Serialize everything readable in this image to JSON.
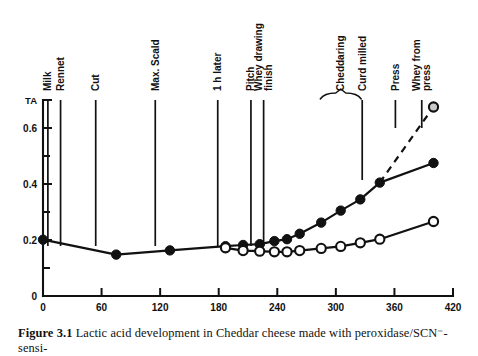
{
  "figure": {
    "caption_label": "Figure 3.1",
    "caption_text": "Lactic acid development in Cheddar cheese made with peroxidase/SCN⁻-sensi-"
  },
  "chart_data": {
    "type": "line",
    "title": "",
    "xlabel": "Time, min",
    "ylabel": "TA",
    "xlim": [
      0,
      420
    ],
    "ylim": [
      0,
      0.72
    ],
    "grid": false,
    "legend_position": "none",
    "x_ticks": [
      0,
      60,
      120,
      180,
      240,
      300,
      360,
      420
    ],
    "x_tick_labels": [
      "0",
      "60",
      "120",
      "180",
      "240",
      "300",
      "360",
      "420"
    ],
    "y_ticks": [
      0,
      0.2,
      0.4,
      0.6
    ],
    "y_tick_labels": [
      "0",
      "0.2",
      "0.4",
      "0.6"
    ],
    "y_minor_ticks": [
      0.1,
      0.3,
      0.5,
      0.7
    ],
    "series": [
      {
        "name": "control",
        "marker": "filled-circle",
        "linestyle": "solid",
        "x": [
          0,
          75,
          130,
          187,
          205,
          222,
          237,
          250,
          263,
          285,
          305,
          325,
          345,
          400
        ],
        "y": [
          0.201,
          0.148,
          0.163,
          0.178,
          0.182,
          0.185,
          0.196,
          0.203,
          0.222,
          0.262,
          0.305,
          0.345,
          0.405,
          0.475
        ]
      },
      {
        "name": "peroxidase-treated",
        "marker": "open-circle",
        "linestyle": "solid",
        "x": [
          187,
          205,
          222,
          237,
          250,
          263,
          285,
          305,
          325,
          345,
          400
        ],
        "y": [
          0.172,
          0.162,
          0.16,
          0.158,
          0.158,
          0.162,
          0.17,
          0.177,
          0.19,
          0.203,
          0.266
        ]
      },
      {
        "name": "whey-from-press",
        "marker": "shaded-circle",
        "linestyle": "dashed",
        "x": [
          345,
          400
        ],
        "y": [
          0.405,
          0.675
        ]
      }
    ],
    "events": [
      {
        "label": "Milk",
        "x": 5,
        "length": "long"
      },
      {
        "label": "Rennet",
        "x": 18,
        "length": "long"
      },
      {
        "label": "Cut",
        "x": 54,
        "length": "long"
      },
      {
        "label": "Max. Scald",
        "x": 115,
        "length": "long"
      },
      {
        "label": "1 h later",
        "x": 179,
        "length": "long"
      },
      {
        "label": "Pitch",
        "x": 213,
        "length": "long"
      },
      {
        "label": "Whey drawing\nfinish",
        "x": 226,
        "length": "long"
      },
      {
        "label": "Cheddaring",
        "x": 282,
        "length": "brace"
      },
      {
        "label": "Curd milled",
        "x": 327,
        "length": "medium"
      },
      {
        "label": "Press",
        "x": 361,
        "length": "short"
      },
      {
        "label": "Whey from\npress",
        "x": 388,
        "length": "short"
      }
    ]
  }
}
